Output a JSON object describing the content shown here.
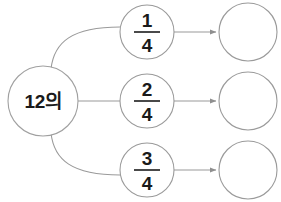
{
  "diagram": {
    "type": "fraction-of-quantity-flow",
    "background_color": "#ffffff",
    "line_color": "#9a9a9a",
    "text_color": "#1a1a1a",
    "source": {
      "label": "12의",
      "cx": 43,
      "cy": 101,
      "r": 35
    },
    "rows": [
      {
        "id": "row-1",
        "fraction": {
          "numerator": "1",
          "denominator": "4",
          "cx": 147,
          "cy": 32,
          "r": 27
        },
        "result": {
          "label": "",
          "cx": 248,
          "cy": 32,
          "r": 29
        }
      },
      {
        "id": "row-2",
        "fraction": {
          "numerator": "2",
          "denominator": "4",
          "cx": 147,
          "cy": 101,
          "r": 27
        },
        "result": {
          "label": "",
          "cx": 248,
          "cy": 101,
          "r": 29
        }
      },
      {
        "id": "row-3",
        "fraction": {
          "numerator": "3",
          "denominator": "4",
          "cx": 147,
          "cy": 170,
          "r": 27
        },
        "result": {
          "label": "",
          "cx": 248,
          "cy": 170,
          "r": 29
        }
      }
    ]
  }
}
